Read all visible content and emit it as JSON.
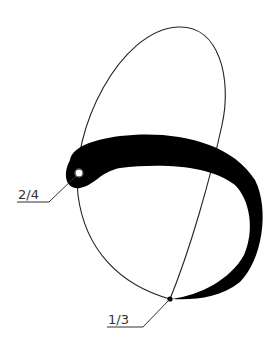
{
  "diagram": {
    "labels": {
      "upper_left": "2/4",
      "bottom": "1/3"
    },
    "colors": {
      "stroke": "#222222",
      "fill": "#000000",
      "label": "#333333"
    }
  }
}
